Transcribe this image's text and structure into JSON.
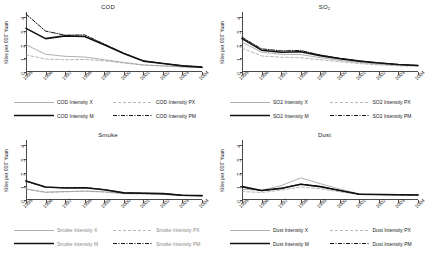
{
  "figure": {
    "ylabel": "Kilos per 000' Yuan",
    "yticks": [
      "0",
      "1",
      "2",
      "3",
      "4"
    ],
    "ylim": [
      0,
      4.4
    ],
    "xticks": [
      "1995",
      "1996",
      "1997",
      "1998",
      "1999",
      "2000",
      "2001",
      "2002",
      "2003",
      "2004"
    ],
    "colors": {
      "X": "#9a9a9a",
      "PX": "#9a9a9a",
      "M": "#111111",
      "PM": "#111111",
      "axis": "#4a4a4a",
      "background": "#ffffff"
    }
  },
  "chart_data": [
    {
      "type": "line",
      "title": "COD",
      "xlabel": "",
      "ylabel": "Kilos per 000' Yuan",
      "x": [
        "1995",
        "1996",
        "1997",
        "1998",
        "1999",
        "2000",
        "2001",
        "2002",
        "2003",
        "2004"
      ],
      "ylim": [
        0,
        4.4
      ],
      "grid": false,
      "legend_position": "below",
      "series": [
        {
          "name": "COD Intensity X",
          "style": "solid-thin-gray",
          "values": [
            2.0,
            1.3,
            1.15,
            1.1,
            0.9,
            0.7,
            0.52,
            0.45,
            0.38,
            0.33
          ]
        },
        {
          "name": "COD Intensity PX",
          "style": "dashed-gray",
          "values": [
            1.25,
            0.95,
            0.9,
            0.92,
            0.82,
            0.66,
            0.5,
            0.44,
            0.37,
            0.32
          ]
        },
        {
          "name": "COD Intensity M",
          "style": "solid-thick-black",
          "values": [
            3.2,
            2.45,
            2.65,
            2.6,
            2.0,
            1.35,
            0.8,
            0.62,
            0.45,
            0.36
          ]
        },
        {
          "name": "COD Intensity PM",
          "style": "dash-dot-black",
          "values": [
            4.25,
            3.0,
            2.7,
            2.72,
            2.05,
            1.38,
            0.82,
            0.63,
            0.46,
            0.36
          ]
        }
      ]
    },
    {
      "type": "line",
      "title": "SO2",
      "title_sub": "2",
      "title_base": "SO",
      "xlabel": "",
      "ylabel": "Kilos per 000' Yuan",
      "x": [
        "1995",
        "1996",
        "1997",
        "1998",
        "1999",
        "2000",
        "2001",
        "2002",
        "2003",
        "2004"
      ],
      "ylim": [
        0,
        4.4
      ],
      "grid": false,
      "legend_position": "below",
      "series": [
        {
          "name": "SO2 Intensity X",
          "style": "solid-thin-gray",
          "values": [
            2.2,
            1.45,
            1.3,
            1.28,
            1.05,
            0.85,
            0.7,
            0.58,
            0.5,
            0.46
          ]
        },
        {
          "name": "SO2 Intensity PX",
          "style": "dashed-gray",
          "values": [
            1.75,
            1.18,
            1.08,
            1.05,
            0.9,
            0.75,
            0.62,
            0.52,
            0.45,
            0.42
          ]
        },
        {
          "name": "SO2 Intensity M",
          "style": "solid-thick-black",
          "values": [
            2.45,
            1.6,
            1.45,
            1.48,
            1.2,
            0.98,
            0.8,
            0.66,
            0.55,
            0.48
          ]
        },
        {
          "name": "SO2 Intensity PM",
          "style": "dash-dot-black",
          "values": [
            2.55,
            1.7,
            1.55,
            1.58,
            1.25,
            1.0,
            0.81,
            0.67,
            0.55,
            0.48
          ]
        }
      ]
    },
    {
      "type": "line",
      "title": "Smoke",
      "xlabel": "",
      "ylabel": "Kilos per 000' Yuan",
      "x": [
        "1995",
        "1996",
        "1997",
        "1998",
        "1999",
        "2000",
        "2001",
        "2002",
        "2003",
        "2004"
      ],
      "ylim": [
        0,
        4.4
      ],
      "grid": false,
      "legend_position": "below",
      "series": [
        {
          "name": "Smoke Intensity X",
          "style": "solid-thin-gray",
          "values": [
            0.82,
            0.58,
            0.62,
            0.66,
            0.6,
            0.48,
            0.46,
            0.42,
            0.33,
            0.31
          ]
        },
        {
          "name": "Smoke Intensity PX",
          "style": "dashed-gray",
          "values": [
            0.78,
            0.55,
            0.6,
            0.64,
            0.58,
            0.46,
            0.45,
            0.41,
            0.32,
            0.3
          ]
        },
        {
          "name": "Smoke Intensity M",
          "style": "solid-thick-black",
          "values": [
            1.4,
            0.95,
            0.88,
            0.9,
            0.75,
            0.52,
            0.5,
            0.47,
            0.35,
            0.32
          ]
        },
        {
          "name": "Smoke Intensity PM",
          "style": "dash-dot-black",
          "values": [
            1.38,
            0.93,
            0.9,
            0.92,
            0.76,
            0.53,
            0.5,
            0.47,
            0.35,
            0.32
          ]
        }
      ]
    },
    {
      "type": "line",
      "title": "Dust",
      "xlabel": "",
      "ylabel": "Kilos per 000' Yuan",
      "x": [
        "1995",
        "1996",
        "1997",
        "1998",
        "1999",
        "2000",
        "2001",
        "2002",
        "2003",
        "2004"
      ],
      "ylim": [
        0,
        4.4
      ],
      "grid": false,
      "legend_position": "below",
      "series": [
        {
          "name": "Dust Intensity X",
          "style": "solid-thin-gray",
          "values": [
            0.78,
            0.72,
            1.05,
            1.62,
            1.2,
            0.8,
            0.45,
            0.42,
            0.4,
            0.38
          ]
        },
        {
          "name": "Dust Intensity PX",
          "style": "dashed-gray",
          "values": [
            0.62,
            0.55,
            0.72,
            0.95,
            0.82,
            0.6,
            0.4,
            0.38,
            0.36,
            0.35
          ]
        },
        {
          "name": "Dust Intensity M",
          "style": "solid-thick-black",
          "values": [
            0.98,
            0.7,
            0.85,
            1.15,
            0.98,
            0.7,
            0.42,
            0.4,
            0.38,
            0.37
          ]
        },
        {
          "name": "Dust Intensity PM",
          "style": "dash-dot-black",
          "values": [
            0.95,
            0.68,
            0.86,
            1.16,
            0.99,
            0.7,
            0.42,
            0.4,
            0.38,
            0.37
          ]
        }
      ]
    }
  ]
}
